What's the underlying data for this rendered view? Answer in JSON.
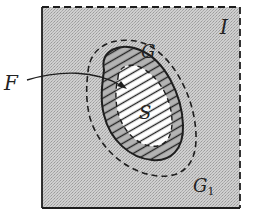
{
  "diagram": {
    "type": "set-region-diagram",
    "labels": {
      "outer_square": "I",
      "dashed_region": "G",
      "hatched_region": "F",
      "inner_set": "S",
      "complement_region": "G",
      "complement_subscript": "1"
    },
    "colors": {
      "stipple_fill": "#c4c4c4",
      "ink": "#1e1e1e",
      "inner_fill": "#ffffff",
      "hatch_band": "#b3b3b3"
    },
    "borders": {
      "square_left_bottom": "solid",
      "square_top_right": "dashed",
      "G_boundary": "dashed",
      "F_outer_boundary": "solid",
      "S_boundary": "dashed"
    }
  }
}
